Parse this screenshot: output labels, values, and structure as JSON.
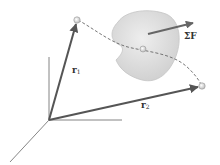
{
  "diagram": {
    "type": "kinematics-vector-diagram",
    "colors": {
      "background": "#ffffff",
      "axis": "#555555",
      "vector": "#555555",
      "path": "#666666",
      "body_fill": "#d9d9d9",
      "body_stroke": "#bbbbbb",
      "force_arrow": "#666666",
      "label": "#333333"
    },
    "labels": {
      "r1": {
        "base": "r",
        "sub": "1"
      },
      "r2": {
        "base": "r",
        "sub": "2"
      },
      "force": "ΣF"
    },
    "elements": {
      "origin": {
        "x": 49,
        "y": 120
      },
      "axes": [
        {
          "name": "vertical-axis",
          "x2": 49,
          "y2": 57
        },
        {
          "name": "horizontal-axis",
          "x2": 122,
          "y2": 120
        },
        {
          "name": "depth-axis",
          "x2": 10,
          "y2": 162
        }
      ],
      "position_vectors": [
        {
          "name": "r1",
          "tip": {
            "x": 77,
            "y": 20
          }
        },
        {
          "name": "r2",
          "tip": {
            "x": 202,
            "y": 86
          }
        }
      ],
      "body_center": {
        "x": 146,
        "y": 50
      }
    }
  }
}
